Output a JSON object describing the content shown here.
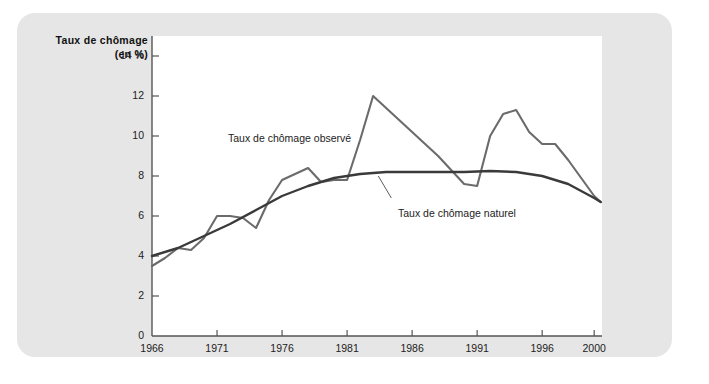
{
  "figure": {
    "panel_color": "#e6e6e6",
    "plot_background": "#ffffff"
  },
  "chart_data": {
    "type": "line",
    "title": "",
    "subtitle": "",
    "ylabel_line1": "Taux de chômage",
    "ylabel_line2": "(en %)",
    "xlabel": "",
    "xlim": [
      1966,
      2000.6
    ],
    "ylim": [
      0,
      15
    ],
    "grid": false,
    "legend_position": "inline-annotations",
    "yticks": [
      0,
      2,
      4,
      6,
      8,
      10,
      12,
      14
    ],
    "ytick_labels": [
      "0",
      "2",
      "4",
      "6",
      "8",
      "10",
      "12",
      "14 %"
    ],
    "xticks": [
      1966,
      1971,
      1976,
      1981,
      1986,
      1991,
      1996,
      2000
    ],
    "xtick_labels": [
      "1966",
      "1971",
      "1976",
      "1981",
      "1986",
      "1991",
      "1996",
      "2000"
    ],
    "series": [
      {
        "name": "Taux de chômage observé",
        "color": "#6b6b6b",
        "width": 2.1,
        "annotation": "Taux de chômage observé",
        "x": [
          1966,
          1967,
          1968,
          1969,
          1970,
          1971,
          1972,
          1973,
          1974,
          1975,
          1976,
          1977,
          1978,
          1979,
          1980,
          1981,
          1982,
          1983,
          1984,
          1985,
          1986,
          1987,
          1988,
          1989,
          1990,
          1991,
          1992,
          1993,
          1994,
          1995,
          1996,
          1997,
          1998,
          1999,
          2000,
          2000.5
        ],
        "values": [
          3.5,
          3.9,
          4.4,
          4.3,
          4.9,
          6.0,
          6.0,
          5.9,
          5.4,
          6.8,
          7.8,
          8.1,
          8.4,
          7.7,
          7.8,
          7.8,
          9.8,
          12.0,
          11.4,
          10.8,
          10.2,
          9.6,
          9.0,
          8.3,
          7.6,
          7.5,
          10.0,
          11.1,
          11.3,
          10.2,
          9.6,
          9.6,
          8.8,
          7.9,
          7.0,
          6.7
        ]
      },
      {
        "name": "Taux de chômage naturel",
        "color": "#3a3a3a",
        "width": 2.4,
        "annotation": "Taux de chômage naturel",
        "x": [
          1966,
          1968,
          1970,
          1972,
          1974,
          1976,
          1978,
          1980,
          1982,
          1984,
          1986,
          1988,
          1990,
          1992,
          1994,
          1996,
          1998,
          2000,
          2000.5
        ],
        "values": [
          4.0,
          4.4,
          5.0,
          5.6,
          6.3,
          7.0,
          7.5,
          7.9,
          8.1,
          8.2,
          8.2,
          8.2,
          8.2,
          8.25,
          8.2,
          8.0,
          7.6,
          6.9,
          6.7
        ]
      }
    ],
    "annotations": [
      {
        "name": "observed-label",
        "text": "Taux de chômage observé",
        "x": 1971.8,
        "y": 10.9
      },
      {
        "name": "natural-label",
        "text": "Taux de chômage naturel",
        "x": 1984.6,
        "y": 6.6,
        "leader_from": [
          1984.4,
          6.9
        ],
        "leader_to": [
          1983.4,
          8.0
        ]
      }
    ]
  }
}
